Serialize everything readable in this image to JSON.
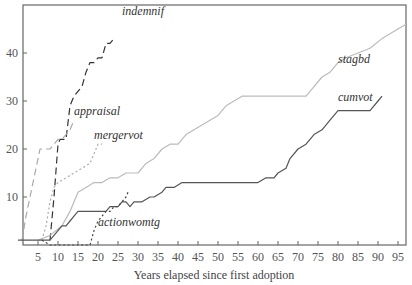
{
  "chart_data": {
    "type": "line",
    "title": "",
    "xlabel": "Years elapsed since first adoption",
    "ylabel": "",
    "xlim": [
      0,
      97
    ],
    "ylim": [
      0,
      47
    ],
    "x_ticks": [
      5,
      10,
      15,
      20,
      25,
      30,
      35,
      40,
      45,
      50,
      55,
      60,
      65,
      70,
      75,
      80,
      85,
      90,
      95
    ],
    "y_ticks": [
      10,
      20,
      30,
      40
    ],
    "grid": false,
    "legend": "inline labels",
    "series": [
      {
        "name": "indemnif",
        "style": "long-dash",
        "color": "#333333",
        "points": [
          [
            8,
            1
          ],
          [
            9,
            10
          ],
          [
            10,
            21
          ],
          [
            10.5,
            22
          ],
          [
            12,
            22
          ],
          [
            13,
            29
          ],
          [
            14,
            31
          ],
          [
            15,
            32
          ],
          [
            16,
            33
          ],
          [
            17,
            36
          ],
          [
            18,
            38
          ],
          [
            19,
            38
          ],
          [
            20,
            39
          ],
          [
            21,
            39
          ],
          [
            22,
            42
          ],
          [
            23,
            42
          ],
          [
            24,
            43
          ]
        ],
        "label_pos": [
          26,
          48
        ]
      },
      {
        "name": "appraisal",
        "style": "long-dash",
        "color": "#aaaaaa",
        "points": [
          [
            1,
            1
          ],
          [
            2,
            6
          ],
          [
            3,
            10
          ],
          [
            4,
            14
          ],
          [
            5,
            18
          ],
          [
            5.5,
            20
          ],
          [
            8,
            20
          ],
          [
            9,
            21
          ],
          [
            10,
            22
          ],
          [
            11,
            22
          ],
          [
            13,
            24
          ],
          [
            14,
            26
          ]
        ],
        "label_pos": [
          14,
          27
        ]
      },
      {
        "name": "mergervot",
        "style": "dotted",
        "color": "#aaaaaa",
        "points": [
          [
            6,
            1
          ],
          [
            7,
            4
          ],
          [
            8,
            9
          ],
          [
            9,
            12
          ],
          [
            10,
            13
          ],
          [
            12,
            14
          ],
          [
            14,
            15
          ],
          [
            16,
            16
          ],
          [
            18,
            17
          ],
          [
            19,
            19
          ],
          [
            20,
            21
          ],
          [
            21,
            21
          ]
        ],
        "label_pos": [
          19,
          22
        ]
      },
      {
        "name": "stagbd",
        "style": "solid",
        "color": "#bbbbbb",
        "points": [
          [
            5,
            1
          ],
          [
            8,
            2
          ],
          [
            11,
            4
          ],
          [
            13,
            7
          ],
          [
            15,
            11
          ],
          [
            17,
            12
          ],
          [
            19,
            13
          ],
          [
            21,
            13
          ],
          [
            23,
            14
          ],
          [
            25,
            14
          ],
          [
            27,
            15
          ],
          [
            30,
            15
          ],
          [
            32,
            17
          ],
          [
            34,
            18
          ],
          [
            36,
            20
          ],
          [
            38,
            21
          ],
          [
            40,
            21
          ],
          [
            42,
            23
          ],
          [
            44,
            24
          ],
          [
            46,
            25
          ],
          [
            48,
            26
          ],
          [
            50,
            27
          ],
          [
            52,
            29
          ],
          [
            54,
            30
          ],
          [
            56,
            31
          ],
          [
            72,
            31
          ],
          [
            74,
            33
          ],
          [
            76,
            35
          ],
          [
            78,
            36
          ],
          [
            80,
            38
          ],
          [
            82,
            39
          ],
          [
            85,
            40
          ],
          [
            88,
            41
          ],
          [
            91,
            43
          ],
          [
            93,
            44
          ],
          [
            95,
            45
          ],
          [
            97,
            46
          ]
        ],
        "label_pos": [
          80,
          38
        ]
      },
      {
        "name": "cumvot",
        "style": "solid",
        "color": "#555555",
        "points": [
          [
            0,
            1
          ],
          [
            8,
            1
          ],
          [
            9,
            2
          ],
          [
            10,
            3
          ],
          [
            11,
            4
          ],
          [
            12,
            4
          ],
          [
            13,
            5
          ],
          [
            14,
            6
          ],
          [
            15,
            7
          ],
          [
            17,
            7
          ],
          [
            22,
            7
          ],
          [
            23,
            8
          ],
          [
            25,
            8
          ],
          [
            26,
            9
          ],
          [
            27,
            9
          ],
          [
            28,
            8
          ],
          [
            29,
            9
          ],
          [
            31,
            9
          ],
          [
            33,
            10
          ],
          [
            34,
            10
          ],
          [
            36,
            11
          ],
          [
            37,
            12
          ],
          [
            39,
            12
          ],
          [
            41,
            13
          ],
          [
            44,
            13
          ],
          [
            60,
            13
          ],
          [
            62,
            14
          ],
          [
            64,
            14
          ],
          [
            65,
            15
          ],
          [
            67,
            16
          ],
          [
            68,
            18
          ],
          [
            70,
            20
          ],
          [
            72,
            21
          ],
          [
            74,
            23
          ],
          [
            76,
            24
          ],
          [
            78,
            26
          ],
          [
            80,
            28
          ],
          [
            88,
            28
          ],
          [
            90,
            30
          ],
          [
            91,
            31
          ]
        ],
        "label_pos": [
          80,
          30
        ]
      },
      {
        "name": "actionwomtg",
        "style": "dotted",
        "color": "#444444",
        "points": [
          [
            6,
            1
          ],
          [
            8,
            0
          ],
          [
            18,
            0
          ],
          [
            19,
            3
          ],
          [
            20,
            5
          ],
          [
            21,
            6
          ],
          [
            22,
            7
          ],
          [
            23,
            7
          ],
          [
            24,
            8
          ],
          [
            25,
            8
          ],
          [
            26,
            9
          ],
          [
            27,
            10
          ],
          [
            27.5,
            11
          ]
        ],
        "label_pos": [
          20,
          4
        ]
      }
    ]
  }
}
